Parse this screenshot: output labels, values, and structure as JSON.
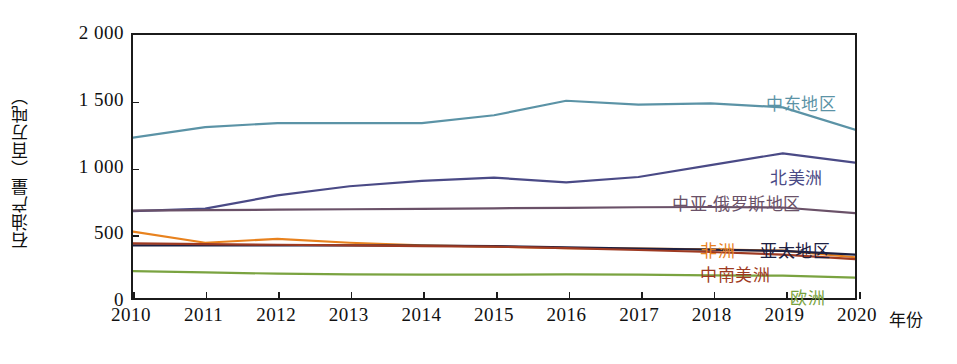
{
  "chart_data": {
    "type": "line",
    "title": "",
    "xlabel": "年份",
    "ylabel": "石油产量（百万吨）",
    "x": [
      2010,
      2011,
      2012,
      2013,
      2014,
      2015,
      2016,
      2017,
      2018,
      2019,
      2020
    ],
    "xlim": [
      2010,
      2020
    ],
    "ylim": [
      0,
      2000
    ],
    "y_ticks": [
      "0",
      "500",
      "1 000",
      "1 500",
      "2 000"
    ],
    "y_tick_values": [
      0,
      500,
      1000,
      1500,
      2000
    ],
    "x_ticks": [
      "2010",
      "2011",
      "2012",
      "2013",
      "2014",
      "2015",
      "2016",
      "2017",
      "2018",
      "2019",
      "2020"
    ],
    "grid": false,
    "legend_position": "inline-right-of-lines",
    "series": [
      {
        "name": "中东地区",
        "color": "#5b93a6",
        "label_x": 766,
        "label_y": 96,
        "values": [
          1220,
          1300,
          1330,
          1330,
          1330,
          1390,
          1500,
          1470,
          1480,
          1450,
          1280
        ]
      },
      {
        "name": "北美洲",
        "color": "#4a4a86",
        "label_x": 770,
        "label_y": 170,
        "values": [
          660,
          680,
          780,
          850,
          890,
          915,
          880,
          920,
          1010,
          1100,
          1030
        ]
      },
      {
        "name": "中亚-俄罗斯地区",
        "color": "#6a5168",
        "label_x": 672,
        "label_y": 196,
        "values": [
          665,
          668,
          672,
          675,
          678,
          682,
          686,
          690,
          692,
          688,
          645
        ]
      },
      {
        "name": "非洲",
        "color": "#e8821e",
        "label_x": 700,
        "label_y": 243,
        "values": [
          505,
          420,
          450,
          420,
          400,
          390,
          380,
          375,
          370,
          360,
          310
        ]
      },
      {
        "name": "亚太地区",
        "color": "#1d2042",
        "label_x": 760,
        "label_y": 243,
        "values": [
          400,
          400,
          400,
          400,
          398,
          395,
          385,
          375,
          368,
          358,
          330
        ]
      },
      {
        "name": "中南美洲",
        "color": "#9e3a22",
        "label_x": 700,
        "label_y": 267,
        "values": [
          415,
          410,
          405,
          400,
          395,
          390,
          380,
          365,
          350,
          330,
          295
        ]
      },
      {
        "name": "欧洲",
        "color": "#7aa340",
        "label_x": 790,
        "label_y": 290,
        "values": [
          205,
          195,
          185,
          180,
          178,
          178,
          180,
          178,
          172,
          170,
          155
        ]
      }
    ]
  },
  "axis": {
    "y_title": "石油产量（百万吨）",
    "x_title": "年份"
  }
}
